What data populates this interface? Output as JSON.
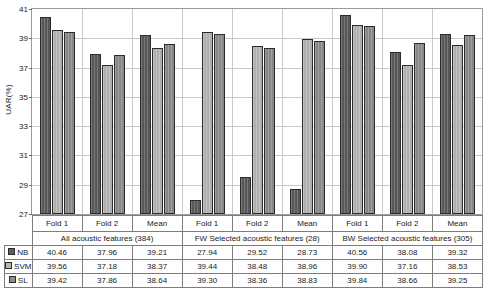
{
  "chart_data": {
    "type": "bar",
    "title": "",
    "xlabel": "",
    "ylabel": "UAR(%)",
    "ylim": [
      27,
      41
    ],
    "yticks": [
      27,
      29,
      31,
      33,
      35,
      37,
      39,
      41
    ],
    "grid": true,
    "legend_position": "table-row-headers",
    "categories": [
      "Fold 1",
      "Fold 2",
      "Mean",
      "Fold 1",
      "Fold 2",
      "Mean",
      "Fold 1",
      "Fold 2",
      "Mean"
    ],
    "group_labels": [
      "All acoustic features (384)",
      "FW Selected acoustic features (28)",
      "BW Selected acoustic features (305)"
    ],
    "group_spans": [
      3,
      3,
      3
    ],
    "series": [
      {
        "name": "NB",
        "color": "#5d5d5d",
        "values": [
          40.46,
          37.96,
          39.21,
          27.94,
          29.52,
          28.73,
          40.56,
          38.08,
          39.32
        ]
      },
      {
        "name": "SVM",
        "color": "#b8b8b8",
        "values": [
          39.56,
          37.18,
          38.37,
          39.44,
          38.48,
          38.96,
          39.9,
          37.16,
          38.53
        ]
      },
      {
        "name": "SL",
        "color": "#8e8e8e",
        "values": [
          39.42,
          37.86,
          38.64,
          39.3,
          38.36,
          38.83,
          39.84,
          38.66,
          39.25
        ]
      }
    ]
  }
}
